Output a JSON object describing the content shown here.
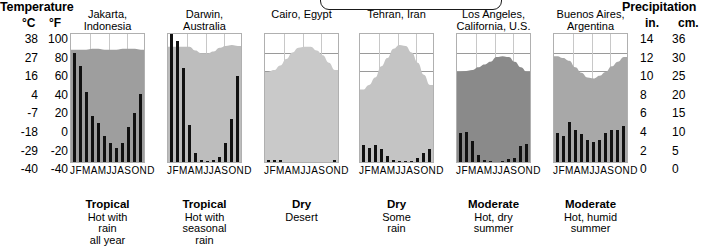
{
  "headers": {
    "temperature": "Temperature",
    "precipitation": "Precipitation"
  },
  "axes": {
    "celsius_label": "°C",
    "fahrenheit_label": "°F",
    "inches_label": "in.",
    "centimeters_label": "cm.",
    "celsius_ticks": [
      "38",
      "27",
      "16",
      "4",
      "-7",
      "-18",
      "-29",
      "-40"
    ],
    "fahrenheit_ticks": [
      "100",
      "80",
      "60",
      "40",
      "20",
      "0",
      "-20",
      "-40"
    ],
    "inches_ticks": [
      "14",
      "12",
      "10",
      "8",
      "6",
      "4",
      "2",
      "0"
    ],
    "centimeters_ticks": [
      "36",
      "30",
      "25",
      "20",
      "15",
      "10",
      "5",
      "0"
    ],
    "month_labels": "JFMAMJJASOND"
  },
  "chart_data": {
    "type": "bar",
    "categories": [
      "J",
      "F",
      "M",
      "A",
      "M",
      "J",
      "J",
      "A",
      "S",
      "O",
      "N",
      "D"
    ],
    "xlabel": "",
    "ylabel": "Precipitation (in.) / Temperature (°F)",
    "ylim_precip_in": [
      0,
      14
    ],
    "ylim_precip_cm": [
      0,
      36
    ],
    "ylim_temp_f": [
      -40,
      100
    ],
    "ylim_temp_c": [
      -40,
      38
    ],
    "grid": true,
    "legend": "none",
    "panels": [
      {
        "city": "Jakarta,\nIndonesia",
        "climate_type": "Tropical",
        "climate_desc": "Hot with\nrain\nall year",
        "precipitation_in": [
          11.7,
          10.3,
          7.5,
          5.0,
          4.2,
          2.8,
          2.0,
          1.5,
          2.0,
          3.8,
          5.3,
          7.3
        ],
        "temperature_f": [
          81,
          81,
          81,
          82,
          82,
          81,
          81,
          81,
          82,
          82,
          82,
          81
        ]
      },
      {
        "city": "Darwin,\nAustralia",
        "climate_type": "Tropical",
        "climate_desc": "Hot with\nseasonal\nrain",
        "precipitation_in": [
          15.3,
          13.0,
          10.1,
          4.0,
          1.0,
          0.2,
          0.1,
          0.2,
          0.5,
          2.0,
          4.6,
          9.3
        ],
        "temperature_f": [
          84,
          84,
          84,
          84,
          80,
          77,
          77,
          79,
          83,
          85,
          86,
          85
        ]
      },
      {
        "city": "Cairo, Egypt",
        "climate_type": "Dry",
        "climate_desc": "Desert",
        "precipitation_in": [
          0.2,
          0.2,
          0.2,
          0.0,
          0.0,
          0.0,
          0.0,
          0.0,
          0.0,
          0.0,
          0.0,
          0.2
        ],
        "temperature_f": [
          57,
          59,
          64,
          71,
          78,
          83,
          84,
          84,
          80,
          75,
          67,
          59
        ]
      },
      {
        "city": "Tehran, Iran",
        "climate_type": "Dry",
        "climate_desc": "Some\nrain",
        "precipitation_in": [
          1.8,
          1.5,
          1.8,
          1.4,
          0.6,
          0.2,
          0.1,
          0.1,
          0.1,
          0.4,
          1.0,
          1.4
        ],
        "temperature_f": [
          38,
          43,
          51,
          63,
          72,
          82,
          86,
          85,
          78,
          67,
          54,
          43
        ]
      },
      {
        "city": "Los Angeles,\nCalifornia, U.S.",
        "climate_type": "Moderate",
        "climate_desc": "Hot, dry\nsummer",
        "precipitation_in": [
          3.1,
          3.2,
          2.3,
          0.8,
          0.2,
          0.1,
          0.0,
          0.1,
          0.3,
          0.4,
          1.7,
          1.9
        ],
        "temperature_f": [
          57,
          58,
          59,
          62,
          65,
          68,
          73,
          74,
          73,
          68,
          62,
          57
        ]
      },
      {
        "city": "Buenos Aires,\nArgentina",
        "climate_type": "Moderate",
        "climate_desc": "Hot, humid\nsummer",
        "precipitation_in": [
          3.1,
          2.8,
          4.3,
          3.5,
          3.0,
          2.4,
          2.2,
          2.4,
          3.1,
          3.5,
          3.4,
          3.9
        ],
        "temperature_f": [
          74,
          72,
          69,
          62,
          56,
          51,
          50,
          53,
          57,
          63,
          68,
          73
        ]
      }
    ]
  }
}
